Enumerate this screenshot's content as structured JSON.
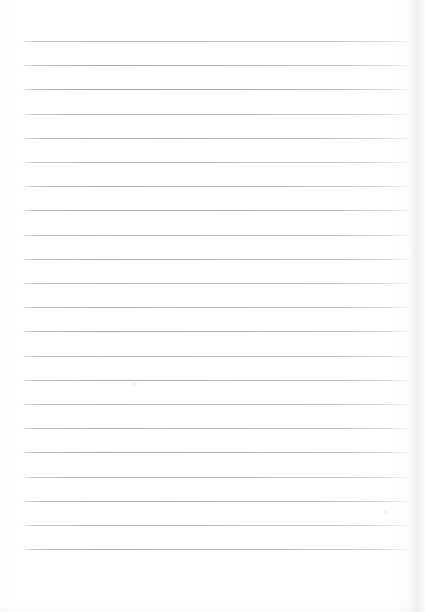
{
  "document": {
    "kind": "scanned-lined-notebook-page",
    "title": "Blank ruled notebook page",
    "page_width": 425,
    "page_height": 612,
    "background_color": "#ffffff",
    "rule_color": "#a8a8b0",
    "body_text": "",
    "has_text_content": false
  },
  "ruling": {
    "line_count": 22,
    "first_line_y": 41,
    "line_spacing": 24.2,
    "left_margin_x": 23,
    "right_margin_x": 409,
    "line_thickness": 1,
    "style": "wide-ruled"
  },
  "artifacts": {
    "right_edge_shadow": true,
    "bottom_edge_shadow": true,
    "smudges": [
      {
        "name": "smudge-upper-left",
        "x": 134,
        "y": 384,
        "size": 5
      },
      {
        "name": "smudge-lower-right",
        "x": 385,
        "y": 512,
        "size": 5
      }
    ]
  }
}
